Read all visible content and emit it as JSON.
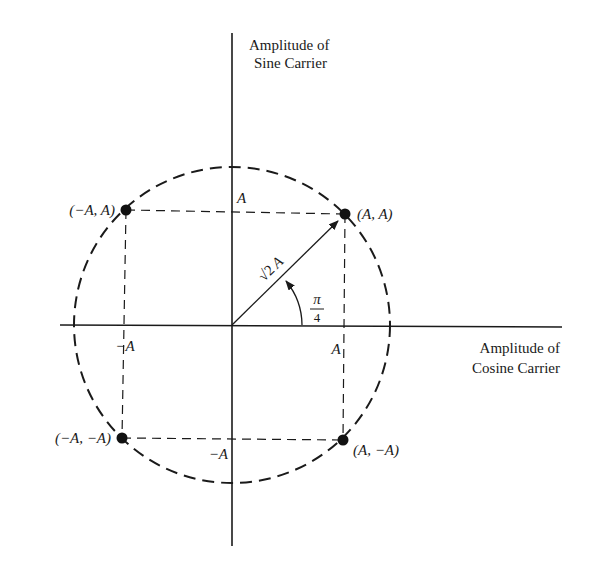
{
  "diagram": {
    "type": "QPSK signal constellation",
    "y_axis_label": [
      "Amplitude of",
      "Sine Carrier"
    ],
    "x_axis_label": [
      "Amplitude of",
      "Cosine Carrier"
    ],
    "points": [
      {
        "label": "(A, A)",
        "i": 1,
        "q": 1
      },
      {
        "label": "(−A, A)",
        "i": -1,
        "q": 1
      },
      {
        "label": "(−A, −A)",
        "i": -1,
        "q": -1
      },
      {
        "label": "(A, −A)",
        "i": 1,
        "q": -1
      }
    ],
    "tick_labels": {
      "x_pos": "A",
      "x_neg": "−A",
      "y_pos": "A",
      "y_neg": "−A"
    },
    "vector_label": "√2 A",
    "vector_label_root": "√2",
    "vector_label_var": "A",
    "angle_label": {
      "numerator": "π",
      "denominator": "4"
    },
    "colors": {
      "ink": "#1a1a1a",
      "background": "#ffffff"
    }
  }
}
